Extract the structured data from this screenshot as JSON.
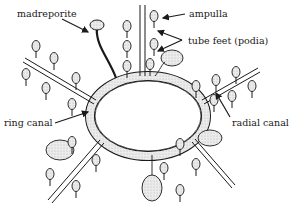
{
  "diagram": {
    "labels": {
      "madreporite": "madreporite",
      "ampulla": "ampulla",
      "tube_feet": "tube feet (podia)",
      "ring_canal": "ring canal",
      "radial_canal": "radial canal"
    },
    "colors": {
      "ink": "#1a1a1a",
      "fill": "#e6e6e6",
      "background": "#ffffff"
    }
  }
}
